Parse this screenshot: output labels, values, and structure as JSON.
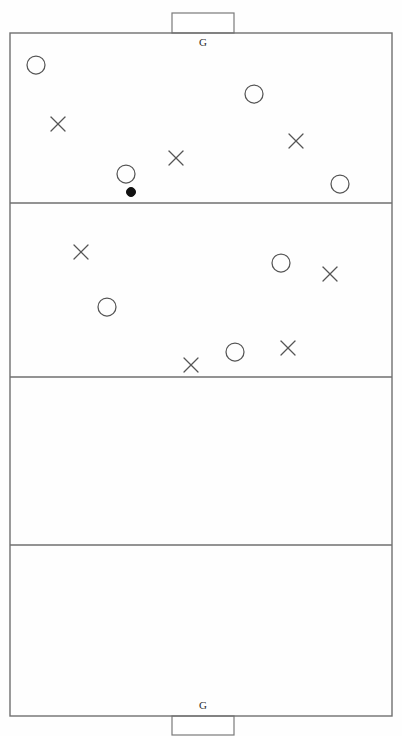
{
  "diagram": {
    "background_color": "#ffffff",
    "line_color": "#6f6f6f",
    "marker_color": "#555555",
    "ball_color": "#111111",
    "field": {
      "x": 10,
      "y": 33,
      "width": 382,
      "height": 683
    },
    "zone_dividers_y": [
      203,
      377,
      545
    ],
    "zones": [
      {
        "name": "zone-1-attacking-third",
        "y_top": 33,
        "y_bottom": 203
      },
      {
        "name": "zone-2-upper-middle",
        "y_top": 203,
        "y_bottom": 377
      },
      {
        "name": "zone-3-lower-middle",
        "y_top": 377,
        "y_bottom": 545
      },
      {
        "name": "zone-4-defending-third",
        "y_top": 545,
        "y_bottom": 716
      }
    ],
    "goals": [
      {
        "id": "goal-top",
        "label": "G",
        "box": {
          "x": 172,
          "y": 13,
          "width": 62,
          "height": 20
        },
        "label_x": 203,
        "label_y": 46
      },
      {
        "id": "goal-bottom",
        "label": "G",
        "box": {
          "x": 172,
          "y": 716,
          "width": 62,
          "height": 19
        },
        "label_x": 203,
        "label_y": 709
      }
    ],
    "markers": {
      "circle_radius": 9,
      "ball_radius": 4.5,
      "cross_arm": 7,
      "circles": [
        {
          "name": "circle-player-1",
          "cx": 36,
          "cy": 65,
          "zone": 1
        },
        {
          "name": "circle-player-2",
          "cx": 254,
          "cy": 94,
          "zone": 1
        },
        {
          "name": "circle-player-3",
          "cx": 126,
          "cy": 174,
          "zone": 1
        },
        {
          "name": "circle-player-4",
          "cx": 340,
          "cy": 184,
          "zone": 1
        },
        {
          "name": "circle-player-5",
          "cx": 281,
          "cy": 263,
          "zone": 2
        },
        {
          "name": "circle-player-6",
          "cx": 107,
          "cy": 307,
          "zone": 2
        },
        {
          "name": "circle-player-7",
          "cx": 235,
          "cy": 352,
          "zone": 2
        }
      ],
      "crosses": [
        {
          "name": "cross-player-1",
          "cx": 58,
          "cy": 124,
          "zone": 1
        },
        {
          "name": "cross-player-2",
          "cx": 176,
          "cy": 158,
          "zone": 1
        },
        {
          "name": "cross-player-3",
          "cx": 296,
          "cy": 141,
          "zone": 1
        },
        {
          "name": "cross-player-4",
          "cx": 81,
          "cy": 252,
          "zone": 2
        },
        {
          "name": "cross-player-5",
          "cx": 330,
          "cy": 274,
          "zone": 2
        },
        {
          "name": "cross-player-6",
          "cx": 288,
          "cy": 348,
          "zone": 2
        },
        {
          "name": "cross-player-7",
          "cx": 191,
          "cy": 365,
          "zone": 2
        }
      ],
      "balls": [
        {
          "name": "ball",
          "cx": 131,
          "cy": 192,
          "zone": 1
        }
      ]
    },
    "counts": {
      "circles": 7,
      "crosses": 7,
      "balls": 1,
      "goals": 2,
      "zones": 4
    }
  }
}
